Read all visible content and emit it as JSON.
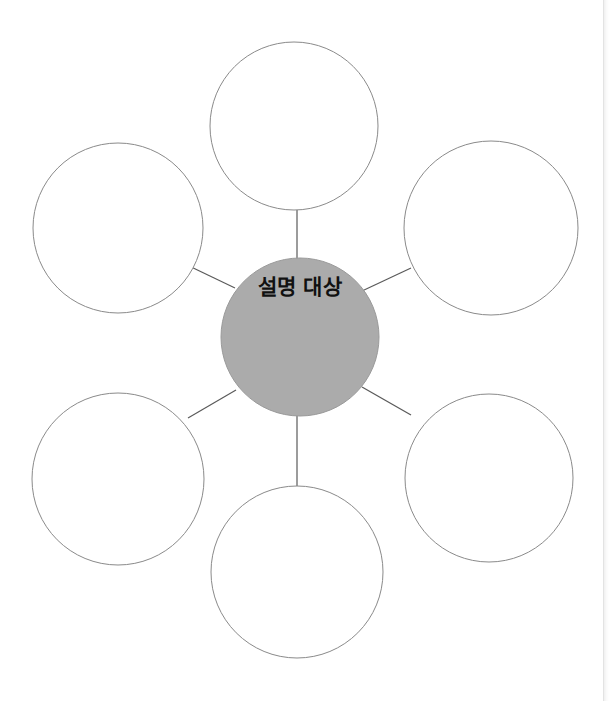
{
  "page": {
    "background_color": "#ffffff",
    "width": 613,
    "height": 701,
    "edge_rule_color": "#e3e3e3"
  },
  "diagram": {
    "type": "radial-bubble-map",
    "title": "",
    "center": {
      "label": "설명 대상",
      "fill_color": "#ababab",
      "stroke_color": "#9a9a9a",
      "text_color": "#111111",
      "cx": 300,
      "cy": 337,
      "r": 79,
      "label_x": 300,
      "label_y": 294
    },
    "satellite_fill_color": "#ffffff",
    "satellite_stroke_color": "#8a8a8a",
    "satellite_stroke_width": 1,
    "connector_color": "#5a5a5a",
    "connector_width": 1.2,
    "satellites": [
      {
        "name": "top",
        "label": "",
        "cx": 294,
        "cy": 126,
        "r": 84
      },
      {
        "name": "top-right",
        "label": "",
        "cx": 491,
        "cy": 228,
        "r": 87
      },
      {
        "name": "bottom-right",
        "label": "",
        "cx": 489,
        "cy": 478,
        "r": 84
      },
      {
        "name": "bottom",
        "label": "",
        "cx": 297,
        "cy": 572,
        "r": 86
      },
      {
        "name": "bottom-left",
        "label": "",
        "cx": 118,
        "cy": 479,
        "r": 86
      },
      {
        "name": "top-left",
        "label": "",
        "cx": 118,
        "cy": 228,
        "r": 85
      }
    ],
    "connectors": [
      {
        "name": "center-to-top",
        "x1": 297,
        "y1": 259,
        "x2": 297,
        "y2": 210
      },
      {
        "name": "center-to-top-right",
        "x1": 362,
        "y1": 291,
        "x2": 411,
        "y2": 268
      },
      {
        "name": "center-to-bottom-right",
        "x1": 362,
        "y1": 387,
        "x2": 411,
        "y2": 415
      },
      {
        "name": "center-to-bottom",
        "x1": 297,
        "y1": 415,
        "x2": 297,
        "y2": 486
      },
      {
        "name": "center-to-bottom-left",
        "x1": 236,
        "y1": 390,
        "x2": 188,
        "y2": 418
      },
      {
        "name": "center-to-top-left",
        "x1": 235,
        "y1": 288,
        "x2": 187,
        "y2": 265
      }
    ]
  }
}
